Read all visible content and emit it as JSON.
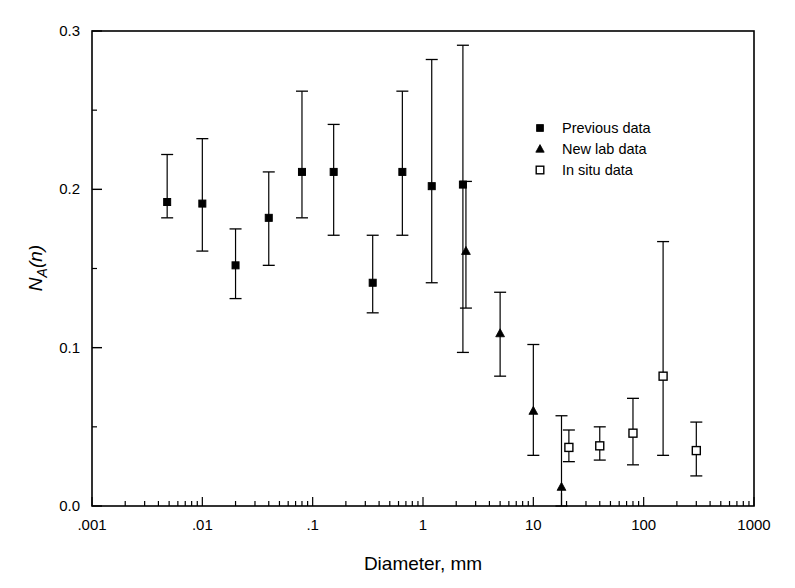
{
  "chart_data": {
    "type": "scatter",
    "title": "",
    "xlabel": "Diameter, mm",
    "ylabel": "N_A(n)",
    "ylabel_parts": {
      "main": "N",
      "sub": "A",
      "paren": "(n)"
    },
    "xscale": "log",
    "yscale": "linear",
    "xlim": [
      0.001,
      1000
    ],
    "ylim": [
      0.0,
      0.3
    ],
    "grid": false,
    "legend_position": "upper right",
    "xticks": [
      0.001,
      0.01,
      0.1,
      1,
      10,
      100,
      1000
    ],
    "xtick_labels": [
      ".001",
      ".01",
      ".1",
      "1",
      "10",
      "100",
      "1000"
    ],
    "yticks": [
      0.0,
      0.1,
      0.2,
      0.3
    ],
    "ytick_labels": [
      "0.0",
      "0.1",
      "0.2",
      "0.3"
    ],
    "yminor_ticks": [
      0.05,
      0.15,
      0.25
    ],
    "series": [
      {
        "name": "Previous data",
        "marker": "filled-square",
        "points": [
          {
            "x": 0.0048,
            "y": 0.192,
            "yerr_low": 0.182,
            "yerr_high": 0.222
          },
          {
            "x": 0.01,
            "y": 0.191,
            "yerr_low": 0.161,
            "yerr_high": 0.232
          },
          {
            "x": 0.02,
            "y": 0.152,
            "yerr_low": 0.131,
            "yerr_high": 0.175
          },
          {
            "x": 0.04,
            "y": 0.182,
            "yerr_low": 0.152,
            "yerr_high": 0.211
          },
          {
            "x": 0.08,
            "y": 0.211,
            "yerr_low": 0.182,
            "yerr_high": 0.262
          },
          {
            "x": 0.155,
            "y": 0.211,
            "yerr_low": 0.171,
            "yerr_high": 0.241
          },
          {
            "x": 0.35,
            "y": 0.141,
            "yerr_low": 0.122,
            "yerr_high": 0.171
          },
          {
            "x": 0.65,
            "y": 0.211,
            "yerr_low": 0.171,
            "yerr_high": 0.262
          },
          {
            "x": 1.2,
            "y": 0.202,
            "yerr_low": 0.141,
            "yerr_high": 0.282
          },
          {
            "x": 2.3,
            "y": 0.203,
            "yerr_low": 0.097,
            "yerr_high": 0.291
          }
        ]
      },
      {
        "name": "New lab data",
        "marker": "filled-triangle",
        "points": [
          {
            "x": 2.45,
            "y": 0.161,
            "yerr_low": 0.125,
            "yerr_high": 0.205
          },
          {
            "x": 5.0,
            "y": 0.109,
            "yerr_low": 0.082,
            "yerr_high": 0.135
          },
          {
            "x": 10.0,
            "y": 0.06,
            "yerr_low": 0.032,
            "yerr_high": 0.102
          },
          {
            "x": 18.0,
            "y": 0.012,
            "yerr_low": 0.0,
            "yerr_high": 0.057
          }
        ]
      },
      {
        "name": "In situ data",
        "marker": "open-square",
        "points": [
          {
            "x": 21.0,
            "y": 0.037,
            "yerr_low": 0.028,
            "yerr_high": 0.048
          },
          {
            "x": 40.0,
            "y": 0.038,
            "yerr_low": 0.029,
            "yerr_high": 0.05
          },
          {
            "x": 80.0,
            "y": 0.046,
            "yerr_low": 0.026,
            "yerr_high": 0.068
          },
          {
            "x": 150.0,
            "y": 0.082,
            "yerr_low": 0.032,
            "yerr_high": 0.167
          },
          {
            "x": 300.0,
            "y": 0.035,
            "yerr_low": 0.019,
            "yerr_high": 0.053
          }
        ]
      }
    ]
  },
  "legend": {
    "entries": [
      {
        "label": "Previous data",
        "marker": "filled-square"
      },
      {
        "label": "New lab data",
        "marker": "filled-triangle"
      },
      {
        "label": "In situ data",
        "marker": "open-square"
      }
    ]
  },
  "colors": {
    "axis": "#000000",
    "marker": "#000000",
    "background": "#ffffff"
  }
}
